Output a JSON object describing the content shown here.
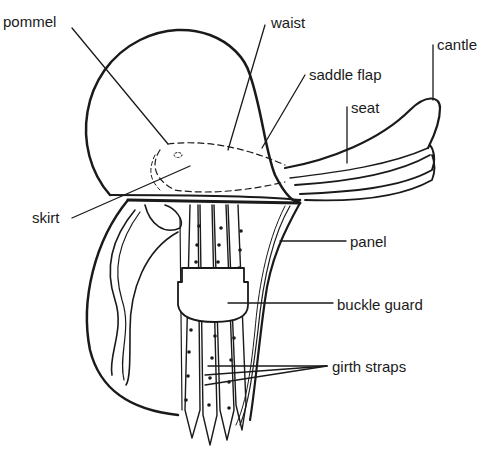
{
  "diagram": {
    "subject": "saddle",
    "labels": {
      "pommel": "pommel",
      "waist": "waist",
      "cantle": "cantle",
      "saddle_flap": "saddle flap",
      "seat": "seat",
      "skirt": "skirt",
      "panel": "panel",
      "buckle_guard": "buckle guard",
      "girth_straps": "girth straps"
    },
    "colors": {
      "ink": "#1a1a1a",
      "background": "#ffffff"
    }
  }
}
